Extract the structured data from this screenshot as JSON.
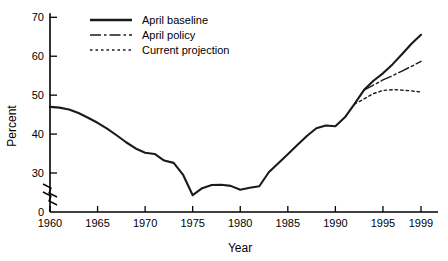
{
  "chart_data": {
    "type": "line",
    "title": "",
    "xlabel": "Year",
    "ylabel": "Percent",
    "xlim": [
      1960,
      1999
    ],
    "ylim": [
      30,
      70
    ],
    "y_axis_break": true,
    "y_axis_zero_tick": "0",
    "grid": false,
    "legend_position": "top-left",
    "xticks": [
      1960,
      1965,
      1970,
      1975,
      1980,
      1985,
      1990,
      1995,
      1999
    ],
    "xticklabels": [
      "1960",
      "1965",
      "1970",
      "1975",
      "1980",
      "1985",
      "1990",
      "1995",
      "1999"
    ],
    "yticks": [
      30,
      40,
      50,
      60,
      70
    ],
    "yticklabels": [
      "30",
      "40",
      "50",
      "60",
      "70"
    ],
    "series": [
      {
        "name": "April baseline",
        "style": "solid",
        "x": [
          1960,
          1961,
          1962,
          1963,
          1964,
          1965,
          1966,
          1967,
          1968,
          1969,
          1970,
          1971,
          1972,
          1973,
          1974,
          1975,
          1976,
          1977,
          1978,
          1979,
          1980,
          1981,
          1982,
          1983,
          1984,
          1985,
          1986,
          1987,
          1988,
          1989,
          1990,
          1991,
          1992,
          1993,
          1994,
          1995,
          1996,
          1997,
          1998,
          1999
        ],
        "values": [
          47.0,
          46.8,
          46.3,
          45.4,
          44.2,
          42.9,
          41.4,
          39.7,
          37.9,
          36.3,
          35.2,
          34.9,
          33.2,
          32.6,
          29.5,
          24.3,
          26.1,
          26.9,
          27.0,
          26.7,
          25.7,
          26.2,
          26.6,
          30.2,
          32.5,
          34.8,
          37.2,
          39.5,
          41.5,
          42.2,
          42.0,
          44.3,
          47.7,
          51.3,
          53.7,
          55.6,
          57.9,
          60.5,
          63.2,
          65.5
        ]
      },
      {
        "name": "April policy",
        "style": "dash-dot",
        "x": [
          1993,
          1994,
          1995,
          1996,
          1997,
          1998,
          1999
        ],
        "values": [
          51.3,
          52.6,
          53.9,
          55.0,
          56.2,
          57.4,
          58.7
        ]
      },
      {
        "name": "Current projection",
        "style": "dotted",
        "x": [
          1992,
          1993,
          1994,
          1995,
          1996,
          1997,
          1998,
          1999
        ],
        "values": [
          47.7,
          49.0,
          50.4,
          51.2,
          51.4,
          51.3,
          51.1,
          50.8
        ]
      }
    ]
  },
  "legend": {
    "items": [
      {
        "label": "April baseline",
        "style": "solid"
      },
      {
        "label": "April policy",
        "style": "dash-dot"
      },
      {
        "label": "Current projection",
        "style": "dotted"
      }
    ]
  }
}
